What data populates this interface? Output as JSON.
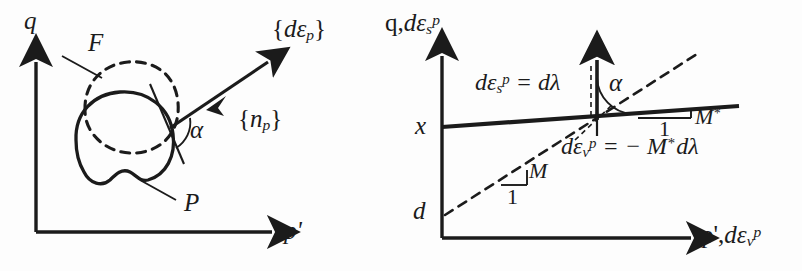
{
  "figure": {
    "background": "#fdfdfd",
    "ink": "#1b1b1b",
    "width": 802,
    "height": 271
  },
  "left_panel": {
    "name": "yield-surface-panel",
    "y_axis_label": "q",
    "x_axis_label": "p'",
    "yield_surface_label": "F",
    "plastic_potential_label": "P",
    "strain_increment_label_parts": {
      "open": "{",
      "base": "dε",
      "sub": "p",
      "close": "}"
    },
    "normal_vector_label_parts": {
      "open": "{",
      "base": "n",
      "sub": "p",
      "close": "}"
    },
    "angle_label": "α"
  },
  "right_panel": {
    "name": "stress-dilatancy-panel",
    "y_axis_label_parts": {
      "q": "q,",
      "base": "dε",
      "sub": "s",
      "sup": "p"
    },
    "x_axis_label_parts": {
      "p": "p',",
      "base": "dε",
      "sub": "v",
      "sup": "p"
    },
    "intercept_solid_label": "x",
    "intercept_dashed_label": "d",
    "angle_label": "α",
    "eq_shear_parts": {
      "base": "dε",
      "sub": "s",
      "sup": "p",
      "rhs": "= dλ"
    },
    "eq_volumetric_parts": {
      "base": "dε",
      "sub": "v",
      "sup": "p",
      "rhs": "= − M",
      "star": "*",
      "tail": "dλ"
    },
    "slope_star_label": "M",
    "slope_star_superscript": "*",
    "slope_star_run": "1",
    "slope_M_label": "M",
    "slope_M_run": "1"
  }
}
